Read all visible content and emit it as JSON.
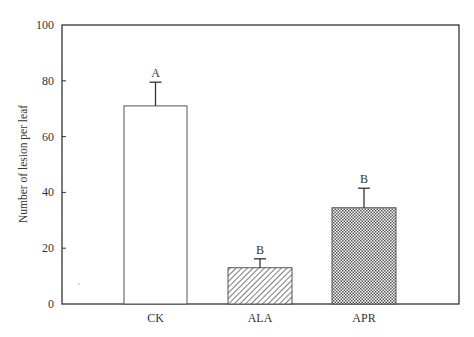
{
  "chart_data": {
    "type": "bar",
    "title": "",
    "xlabel": "",
    "ylabel": "Number of lesion per leaf",
    "ylim": [
      0,
      100
    ],
    "yticks": [
      0,
      20,
      40,
      60,
      80,
      100
    ],
    "grid": false,
    "legend": null,
    "categories": [
      "CK",
      "ALA",
      "APR"
    ],
    "values": [
      71,
      13,
      34.5
    ],
    "error": [
      8.5,
      3.2,
      7
    ],
    "significance_letters": [
      "A",
      "B",
      "B"
    ],
    "fill_patterns": [
      "white",
      "diagonal-hatch",
      "crosshatch"
    ]
  },
  "colors": {
    "axis": "#333333",
    "bar_edge": "#555555",
    "hatch": "#555555"
  }
}
